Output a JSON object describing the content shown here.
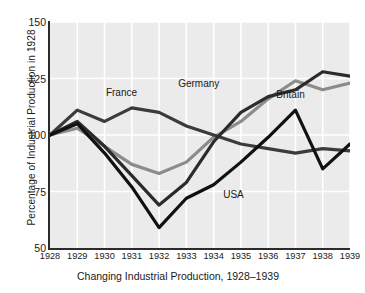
{
  "chart_data": {
    "type": "line",
    "title": "Changing Industrial Production, 1928–1939",
    "xlabel": "",
    "ylabel": "Percentage of Industrial Production in 1928",
    "x": [
      1928,
      1929,
      1930,
      1931,
      1932,
      1933,
      1934,
      1935,
      1936,
      1937,
      1938,
      1939
    ],
    "xticklabels": [
      "1928",
      "1929",
      "1930",
      "1931",
      "1932",
      "1933",
      "1934",
      "1935",
      "1936",
      "1937",
      "1938",
      "1939"
    ],
    "yticklabels": [
      "50",
      "75",
      "100",
      "125",
      "150"
    ],
    "yticks": [
      50,
      75,
      100,
      125,
      150
    ],
    "ylim": [
      50,
      150
    ],
    "xlim": [
      1928,
      1939
    ],
    "grid": true,
    "grid_color": "#ffffff",
    "plot_background": "#ebebeb",
    "legend": "inline-labels",
    "series": [
      {
        "name": "France",
        "color": "#3b3b3b",
        "label_x": 1930.05,
        "label_y": 118.5,
        "values": [
          100,
          111,
          106,
          112,
          110,
          104,
          100,
          96,
          94,
          92,
          94,
          93
        ]
      },
      {
        "name": "Germany",
        "color": "#2b2b2b",
        "label_x": 1932.7,
        "label_y": 122.5,
        "values": [
          100,
          106,
          95,
          82,
          69,
          79,
          97,
          110,
          117,
          120,
          128,
          126
        ]
      },
      {
        "name": "Britain",
        "color": "#8c8c8c",
        "label_x": 1936.3,
        "label_y": 117.5,
        "values": [
          100,
          103,
          95,
          87,
          83,
          88,
          99,
          106,
          116,
          124,
          120,
          123
        ]
      },
      {
        "name": "USA",
        "color": "#111111",
        "label_x": 1934.35,
        "label_y": 73.5,
        "values": [
          100,
          105,
          92,
          77,
          59,
          72,
          78,
          88,
          99,
          111,
          85,
          96
        ]
      }
    ],
    "annotations": [
      {
        "text": "France",
        "x": 1930.05,
        "y": 118.5
      },
      {
        "text": "Germany",
        "x": 1932.7,
        "y": 122.5
      },
      {
        "text": "Britain",
        "x": 1936.3,
        "y": 117.5
      },
      {
        "text": "USA",
        "x": 1934.35,
        "y": 73.5
      }
    ]
  }
}
